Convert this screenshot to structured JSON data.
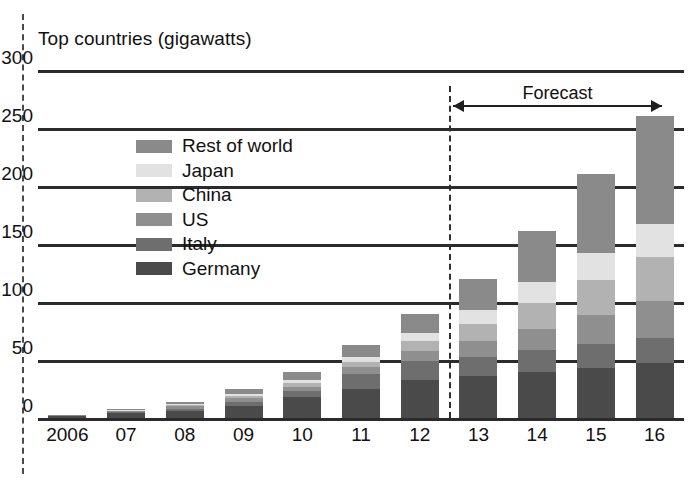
{
  "chart_data": {
    "type": "bar",
    "subtype": "stacked-bar",
    "title": "Top countries (gigawatts)",
    "xlabel": "",
    "ylabel": "",
    "ylim": [
      0,
      300
    ],
    "yticks": [
      0,
      50,
      100,
      150,
      200,
      250,
      300
    ],
    "grid": true,
    "legend_position": "upper-left-inside",
    "categories": [
      "2006",
      "07",
      "08",
      "09",
      "10",
      "11",
      "12",
      "13",
      "14",
      "15",
      "16"
    ],
    "series": [
      {
        "name": "Germany",
        "color": "#4a4a4a",
        "values": [
          2,
          4,
          6,
          10,
          18,
          25,
          33,
          36,
          40,
          43,
          47
        ]
      },
      {
        "name": "Italy",
        "color": "#6e6e6e",
        "values": [
          0,
          1,
          2,
          4,
          5,
          13,
          16,
          17,
          19,
          21,
          22
        ]
      },
      {
        "name": "US",
        "color": "#8f8f8f",
        "values": [
          0,
          1,
          2,
          3,
          4,
          6,
          9,
          13,
          18,
          25,
          32
        ]
      },
      {
        "name": "China",
        "color": "#b2b2b2",
        "values": [
          0,
          0,
          1,
          2,
          3,
          4,
          8,
          15,
          22,
          30,
          38
        ]
      },
      {
        "name": "Japan",
        "color": "#e2e2e2",
        "values": [
          0,
          1,
          1,
          2,
          3,
          5,
          7,
          12,
          18,
          23,
          28
        ]
      },
      {
        "name": "Rest of world",
        "color": "#8a8a8a",
        "values": [
          1,
          1,
          2,
          4,
          7,
          10,
          17,
          27,
          44,
          68,
          93
        ]
      }
    ],
    "totals": [
      3,
      8,
      14,
      25,
      40,
      63,
      90,
      120,
      161,
      210,
      260
    ],
    "annotations": [
      {
        "name": "forecast",
        "label": "Forecast",
        "from_category": "13",
        "to_category": "16"
      }
    ],
    "divider": {
      "after_category": "12",
      "style": "dashed"
    }
  },
  "legend": {
    "items": [
      {
        "label": "Rest of world",
        "color": "#8a8a8a"
      },
      {
        "label": "Japan",
        "color": "#e2e2e2"
      },
      {
        "label": "China",
        "color": "#b2b2b2"
      },
      {
        "label": "US",
        "color": "#8f8f8f"
      },
      {
        "label": "Italy",
        "color": "#6e6e6e"
      },
      {
        "label": "Germany",
        "color": "#4a4a4a"
      }
    ]
  },
  "axis": {
    "y_tick_labels": [
      "300",
      "250",
      "200",
      "150",
      "100",
      "50",
      "0"
    ],
    "x_tick_labels": [
      "2006",
      "07",
      "08",
      "09",
      "10",
      "11",
      "12",
      "13",
      "14",
      "15",
      "16"
    ]
  }
}
